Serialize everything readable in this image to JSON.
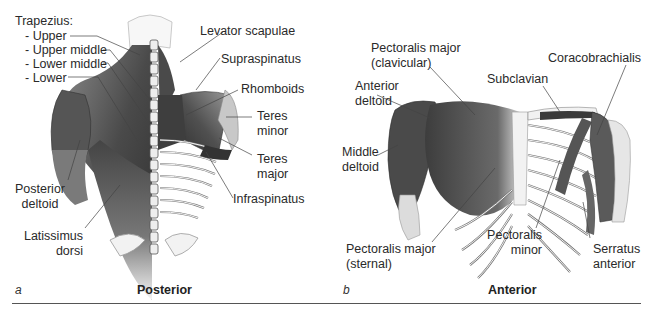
{
  "figure": {
    "panels": [
      {
        "letter": "a",
        "title": "Posterior",
        "labels": {
          "trapezius_heading": "Trapezius:",
          "trap_upper": "- Upper",
          "trap_upper_middle": "- Upper middle",
          "trap_lower_middle": "- Lower middle",
          "trap_lower": "- Lower",
          "levator_scapulae": "Levator scapulae",
          "supraspinatus": "Supraspinatus",
          "rhomboids": "Rhomboids",
          "teres_minor_1": "Teres",
          "teres_minor_2": "minor",
          "teres_major_1": "Teres",
          "teres_major_2": "major",
          "infraspinatus": "Infraspinatus",
          "posterior_deltoid_1": "Posterior",
          "posterior_deltoid_2": "deltoid",
          "latissimus_dorsi_1": "Latissimus",
          "latissimus_dorsi_2": "dorsi"
        }
      },
      {
        "letter": "b",
        "title": "Anterior",
        "labels": {
          "pec_major_clav_1": "Pectoralis major",
          "pec_major_clav_2": "(clavicular)",
          "coracobrachialis": "Coracobrachialis",
          "subclavian": "Subclavian",
          "anterior_deltoid_1": "Anterior",
          "anterior_deltoid_2": "deltoid",
          "middle_deltoid_1": "Middle",
          "middle_deltoid_2": "deltoid",
          "pec_major_stern_1": "Pectoralis major",
          "pec_major_stern_2": "(sternal)",
          "pec_minor_1": "Pectoralis",
          "pec_minor_2": "minor",
          "serratus_anterior_1": "Serratus",
          "serratus_anterior_2": "anterior"
        }
      }
    ],
    "colors": {
      "muscle_dark": "#3a3a3a",
      "muscle_mid": "#6e6e6e",
      "bone": "#f2f2f2",
      "leader_line": "#444444"
    }
  }
}
